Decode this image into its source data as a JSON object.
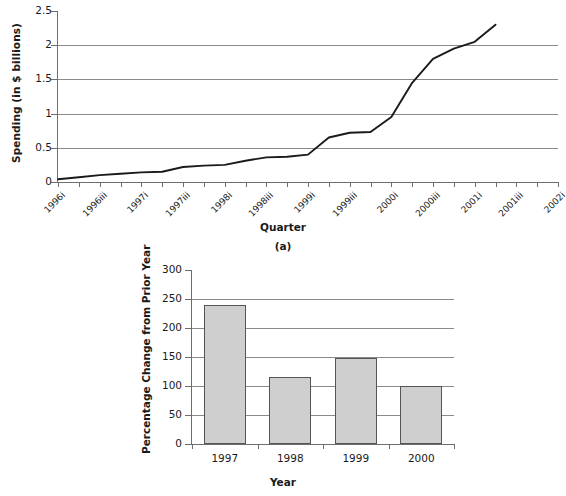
{
  "figure": {
    "panel_a": {
      "caption": "(a)",
      "xlabel": "Quarter",
      "ylabel": "Spending (in $ billions)"
    },
    "panel_b": {
      "caption": "",
      "xlabel": "Year",
      "ylabel": "Percentage Change from Prior Year"
    },
    "colors": {
      "line": "#1a1a1a",
      "gridline": "#8a8a8a",
      "axis": "#6e6e6e",
      "bar_fill": "#cfcfcf",
      "bar_stroke": "#555555",
      "text": "#1a1a1a",
      "background": "#ffffff"
    }
  },
  "chart_data": [
    {
      "type": "line",
      "title": "",
      "panel": "(a)",
      "xlabel": "Quarter",
      "ylabel": "Spending (in $ billions)",
      "ylim": [
        0,
        2.5
      ],
      "ytick_values": [
        0,
        0.5,
        1,
        1.5,
        2,
        2.5
      ],
      "ytick_labels": [
        "0",
        "0.5",
        "1",
        "1.5",
        "2",
        "2.5"
      ],
      "grid": true,
      "legend": "none",
      "x_tick_labels": [
        "1996i",
        "1996iii",
        "1997i",
        "1997iii",
        "1998i",
        "1998iii",
        "1999i",
        "1999iii",
        "2000i",
        "2000iii",
        "2001i",
        "2001iii",
        "2002i"
      ],
      "x_tick_label_interval": 2,
      "x_axis_note": "Quarterly ticks; every other quarter labeled",
      "x": [
        "1996i",
        "1996ii",
        "1996iii",
        "1996iv",
        "1997i",
        "1997ii",
        "1997iii",
        "1997iv",
        "1998i",
        "1998ii",
        "1998iii",
        "1998iv",
        "1999i",
        "1999ii",
        "1999iii",
        "1999iv",
        "2000i",
        "2000ii",
        "2000iii",
        "2000iv",
        "2001i",
        "2001ii"
      ],
      "values": [
        0.04,
        0.07,
        0.1,
        0.12,
        0.14,
        0.15,
        0.22,
        0.24,
        0.25,
        0.31,
        0.36,
        0.37,
        0.4,
        0.65,
        0.72,
        0.73,
        0.95,
        1.45,
        1.8,
        1.95,
        2.05,
        2.3
      ]
    },
    {
      "type": "bar",
      "title": "",
      "panel": "(b)",
      "xlabel": "Year",
      "ylabel": "Percentage Change from Prior Year",
      "ylim": [
        0,
        300
      ],
      "ytick_values": [
        0,
        50,
        100,
        150,
        200,
        250,
        300
      ],
      "ytick_labels": [
        "0",
        "50",
        "100",
        "150",
        "200",
        "250",
        "300"
      ],
      "grid": true,
      "legend": "none",
      "categories": [
        "1997",
        "1998",
        "1999",
        "2000"
      ],
      "values": [
        240,
        116,
        148,
        100
      ]
    }
  ]
}
